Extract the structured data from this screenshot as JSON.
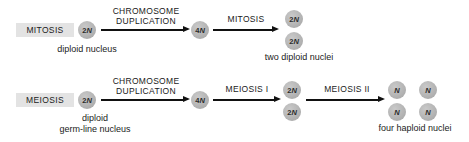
{
  "diagram": {
    "colors": {
      "background": "#ffffff",
      "label_box": "#e3e3e3",
      "nucleus_fill": "#b5b5b5",
      "arrow": "#111111",
      "text": "#1a1a1a"
    },
    "rows": [
      {
        "id": "mitosis-row",
        "process_label": "MITOSIS",
        "start_nucleus": {
          "ploidy": "2",
          "letter": "N"
        },
        "start_caption": "diploid nucleus",
        "step1_label": "CHROMOSOME DUPLICATION",
        "step1_label_line1": "CHROMOSOME",
        "step1_label_line2": "DUPLICATION",
        "middle_nucleus": {
          "ploidy": "4",
          "letter": "N"
        },
        "step2_label": "MITOSIS",
        "products": [
          {
            "ploidy": "2",
            "letter": "N"
          },
          {
            "ploidy": "2",
            "letter": "N"
          }
        ],
        "product_caption": "two diploid nuclei"
      },
      {
        "id": "meiosis-row",
        "process_label": "MEIOSIS",
        "start_nucleus": {
          "ploidy": "2",
          "letter": "N"
        },
        "start_caption_line1": "diploid",
        "start_caption_line2": "germ-line nucleus",
        "step1_label": "CHROMOSOME DUPLICATION",
        "step1_label_line1": "CHROMOSOME",
        "step1_label_line2": "DUPLICATION",
        "middle_nucleus": {
          "ploidy": "4",
          "letter": "N"
        },
        "step2_label": "MEIOSIS I",
        "intermediates": [
          {
            "ploidy": "2",
            "letter": "N"
          },
          {
            "ploidy": "2",
            "letter": "N"
          }
        ],
        "step3_label": "MEIOSIS II",
        "products": [
          {
            "ploidy": "",
            "letter": "N"
          },
          {
            "ploidy": "",
            "letter": "N"
          },
          {
            "ploidy": "",
            "letter": "N"
          },
          {
            "ploidy": "",
            "letter": "N"
          }
        ],
        "product_caption": "four haploid nuclei"
      }
    ]
  }
}
